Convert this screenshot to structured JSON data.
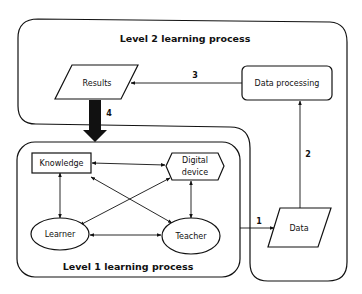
{
  "diagram": {
    "level2": {
      "title": "Level 2 learning process"
    },
    "level1": {
      "title": "Level 1 learning process"
    },
    "nodes": {
      "results": "Results",
      "data_processing": "Data processing",
      "data": "Data",
      "knowledge": "Knowledge",
      "digital_device_line1": "Digital",
      "digital_device_line2": "device",
      "learner": "Learner",
      "teacher": "Teacher"
    },
    "edges": {
      "e1": "1",
      "e2": "2",
      "e3": "3",
      "e4": "4"
    },
    "colors": {
      "line": "#111111",
      "background": "#ffffff"
    }
  }
}
